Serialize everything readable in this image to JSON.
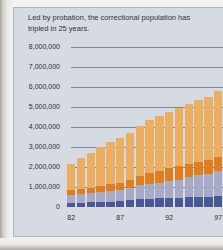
{
  "card": {
    "title": "Led by probation, the correctional population has tripled in 25 years."
  },
  "y_axis": {
    "tick_labels": [
      "8,000,000",
      "7,000,000",
      "6,000,000",
      "5,000,000",
      "4,000,000",
      "3,000,000",
      "2,000,000",
      "1,000,000",
      "0"
    ]
  },
  "x_axis": {
    "tick_labels": [
      "82",
      "87",
      "92",
      "97"
    ],
    "tick_indices": [
      0,
      5,
      10,
      15
    ]
  },
  "colors": {
    "card_background": "#d6dae2",
    "gridline": "#7f8795",
    "text": "#333436",
    "jail_segment": "#4b5897",
    "prison_segment": "#a8abc8",
    "parole_segment": "#e07e1f",
    "probation_segment": "#ecaf62"
  },
  "chart_data": {
    "type": "bar",
    "stacked": true,
    "title": "Led by probation, the correctional population has tripled in 25 years.",
    "x": [
      1982,
      1983,
      1984,
      1985,
      1986,
      1987,
      1988,
      1989,
      1990,
      1991,
      1992,
      1993,
      1994,
      1995,
      1996,
      1997
    ],
    "x_tick_labels": [
      "82",
      "87",
      "92",
      "97"
    ],
    "ylim": [
      0,
      8000000
    ],
    "grid": true,
    "legend": false,
    "series": [
      {
        "name": "jail",
        "color": "#4b5897",
        "values": [
          210000,
          220000,
          230000,
          260000,
          270000,
          300000,
          340000,
          400000,
          410000,
          430000,
          440000,
          460000,
          490000,
          510000,
          520000,
          570000
        ]
      },
      {
        "name": "prison",
        "color": "#a8abc8",
        "values": [
          400000,
          420000,
          450000,
          490000,
          530000,
          560000,
          610000,
          680000,
          740000,
          790000,
          850000,
          910000,
          990000,
          1080000,
          1130000,
          1240000
        ]
      },
      {
        "name": "parole",
        "color": "#e07e1f",
        "values": [
          220000,
          250000,
          270000,
          300000,
          330000,
          360000,
          410000,
          460000,
          530000,
          590000,
          660000,
          680000,
          690000,
          680000,
          680000,
          690000
        ]
      },
      {
        "name": "probation",
        "color": "#ecaf62",
        "values": [
          1340000,
          1580000,
          1740000,
          1970000,
          2110000,
          2250000,
          2360000,
          2520000,
          2670000,
          2730000,
          2810000,
          2900000,
          2980000,
          3080000,
          3160000,
          3300000
        ]
      }
    ]
  },
  "layout_note": "stacked bar chart, bars bottom-to-top: jail, prison, parole, probation"
}
